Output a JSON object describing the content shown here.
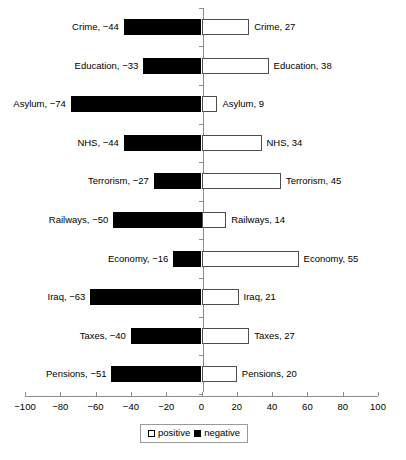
{
  "chart_data": {
    "type": "bar",
    "orientation": "horizontal-diverging",
    "title": "",
    "xlabel": "",
    "ylabel": "",
    "xlim": [
      -100,
      100
    ],
    "xticks": [
      -100,
      -80,
      -60,
      -40,
      -20,
      0,
      20,
      40,
      60,
      80,
      100
    ],
    "xtick_labels": [
      "−100",
      "−80",
      "−60",
      "−40",
      "−20",
      "0",
      "20",
      "40",
      "60",
      "80",
      "100"
    ],
    "grid": false,
    "legend_position": "bottom-center",
    "categories": [
      "Crime",
      "Education",
      "Asylum",
      "NHS",
      "Terrorism",
      "Railways",
      "Economy",
      "Iraq",
      "Taxes",
      "Pensions"
    ],
    "series": [
      {
        "name": "negative",
        "color": "#000000",
        "values": [
          -44,
          -33,
          -74,
          -44,
          -27,
          -50,
          -16,
          -63,
          -40,
          -51
        ]
      },
      {
        "name": "positive",
        "color": "#ffffff",
        "values": [
          27,
          38,
          9,
          34,
          45,
          14,
          55,
          21,
          27,
          20
        ]
      }
    ],
    "rows": [
      {
        "category": "Crime",
        "negative": -44,
        "positive": 27,
        "left_label": "Crime, −44",
        "right_label": "Crime, 27"
      },
      {
        "category": "Education",
        "negative": -33,
        "positive": 38,
        "left_label": "Education, −33",
        "right_label": "Education, 38"
      },
      {
        "category": "Asylum",
        "negative": -74,
        "positive": 9,
        "left_label": "Asylum, −74",
        "right_label": "Asylum, 9"
      },
      {
        "category": "NHS",
        "negative": -44,
        "positive": 34,
        "left_label": "NHS, −44",
        "right_label": "NHS, 34"
      },
      {
        "category": "Terrorism",
        "negative": -27,
        "positive": 45,
        "left_label": "Terrorism, −27",
        "right_label": "Terrorism, 45"
      },
      {
        "category": "Railways",
        "negative": -50,
        "positive": 14,
        "left_label": "Railways, −50",
        "right_label": "Railways, 14"
      },
      {
        "category": "Economy",
        "negative": -16,
        "positive": 55,
        "left_label": "Economy, −16",
        "right_label": "Economy, 55"
      },
      {
        "category": "Iraq",
        "negative": -63,
        "positive": 21,
        "left_label": "Iraq, −63",
        "right_label": "Iraq, 21"
      },
      {
        "category": "Taxes",
        "negative": -40,
        "positive": 27,
        "left_label": "Taxes, −40",
        "right_label": "Taxes, 27"
      },
      {
        "category": "Pensions",
        "negative": -51,
        "positive": 20,
        "left_label": "Pensions, −51",
        "right_label": "Pensions, 20"
      }
    ],
    "legend": [
      {
        "label": "positive",
        "swatch": "white-square",
        "color": "#ffffff"
      },
      {
        "label": "negative",
        "swatch": "black-square",
        "color": "#000000"
      }
    ]
  },
  "layout": {
    "x_left_px": 25,
    "x_right_px": 378,
    "x_zero_px": 203,
    "row_top_px": 19,
    "row_pitch_px": 38.6,
    "bar_height_px": 16,
    "axis_y_px": 396,
    "tick_label_y_px": 401,
    "legend_left_px": 140,
    "legend_top_px": 424
  }
}
